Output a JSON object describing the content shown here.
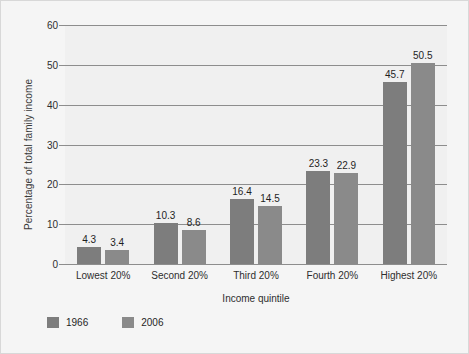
{
  "chart_data": {
    "type": "bar",
    "title": "",
    "xlabel": "Income quintile",
    "ylabel": "Percentage of total family income",
    "categories": [
      "Lowest 20%",
      "Second 20%",
      "Third 20%",
      "Fourth 20%",
      "Highest 20%"
    ],
    "series": [
      {
        "name": "1966",
        "color": "#7d7d7d",
        "values": [
          4.3,
          10.3,
          16.4,
          23.3,
          45.7
        ]
      },
      {
        "name": "2006",
        "color": "#8a8a8a",
        "values": [
          3.4,
          8.6,
          14.5,
          22.9,
          50.5
        ]
      }
    ],
    "value_labels": {
      "1966": [
        "4.3",
        "10.3",
        "16.4",
        "23.3",
        "45.7"
      ],
      "2006": [
        "3.4",
        "8.6",
        "14.5",
        "22.9",
        "50.5"
      ]
    },
    "ylim": [
      0,
      60
    ],
    "yticks": [
      0,
      10,
      20,
      30,
      40,
      50,
      60
    ],
    "ytick_labels": [
      "0",
      "10",
      "20",
      "30",
      "40",
      "50",
      "60"
    ],
    "grid": "horizontal",
    "legend_position": "bottom-left",
    "background": "#f0f0f0",
    "gridline_color": "#8d8d8d"
  },
  "axis": {
    "y_title": "Percentage of total family income",
    "x_title": "Income quintile"
  },
  "legend": {
    "items": [
      {
        "label": "1966"
      },
      {
        "label": "2006"
      }
    ]
  }
}
